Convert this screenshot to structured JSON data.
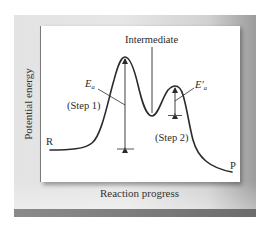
{
  "figure": {
    "x_axis_label": "Reaction progress",
    "y_axis_label": "Potential energy",
    "labels": {
      "intermediate": "Intermediate",
      "reactants": "R",
      "products": "P",
      "step1": "(Step 1)",
      "step2": "(Step 2)",
      "ea_symbol": "E",
      "ea_sub": "a",
      "ea_prime_symbol": "E′",
      "ea_prime_sub": "a"
    },
    "colors": {
      "curve": "#2b2b2b",
      "panel_background": "#e4e4e4",
      "plot_background": "#ffffff",
      "bottom_bar": "#7c7c7c"
    }
  }
}
